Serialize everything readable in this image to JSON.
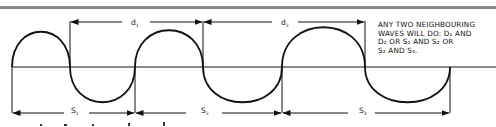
{
  "diagram": {
    "type": "wavelength-measurement",
    "colors": {
      "ink": "#111111",
      "top_rule": "#8a8a8a",
      "background": "#ffffff"
    },
    "crest_spacings": [
      {
        "label": "d",
        "subscript": "1"
      },
      {
        "label": "d",
        "subscript": "2"
      }
    ],
    "cycle_spans": [
      {
        "label": "S",
        "subscript": "1"
      },
      {
        "label": "S",
        "subscript": "2"
      },
      {
        "label": "S",
        "subscript": "3"
      }
    ],
    "note": {
      "lines": [
        "ANY TWO NEIGHBOURING",
        "WAVES WILL DO: d₁ AND",
        "d₂ OR S₁ AND S₂ OR",
        "S₂ AND S₃."
      ]
    }
  }
}
